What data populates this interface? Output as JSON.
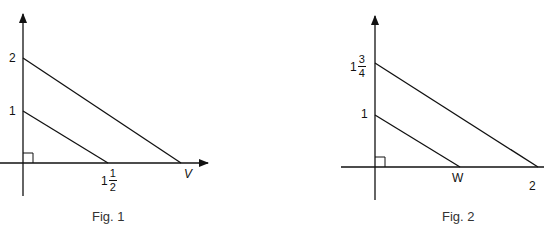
{
  "figures": [
    {
      "caption": "Fig. 1",
      "y_labels": {
        "upper": "2",
        "lower": "1"
      },
      "x_labels": {
        "inner_whole": "1",
        "inner_num": "1",
        "inner_den": "2",
        "outer": "V"
      }
    },
    {
      "caption": "Fig. 2",
      "y_labels": {
        "upper_whole": "1",
        "upper_num": "3",
        "upper_den": "4",
        "lower": "1"
      },
      "x_labels": {
        "inner": "W",
        "outer_whole": "2"
      }
    }
  ],
  "colors": {
    "line": "#111111",
    "background": "#ffffff"
  }
}
